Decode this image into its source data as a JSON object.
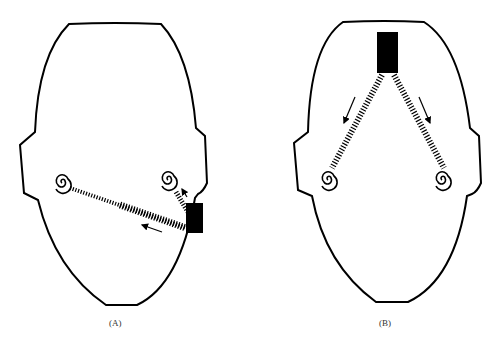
{
  "panels": [
    {
      "id": "A",
      "label": "(A)",
      "description": "Head outline, sound source at lower right of face; waves travel to near and far ear"
    },
    {
      "id": "B",
      "label": "(B)",
      "description": "Head outline, sound source at top center; waves travel equally to both ears"
    }
  ],
  "colors": {
    "ink": "#000000",
    "background": "#ffffff"
  }
}
